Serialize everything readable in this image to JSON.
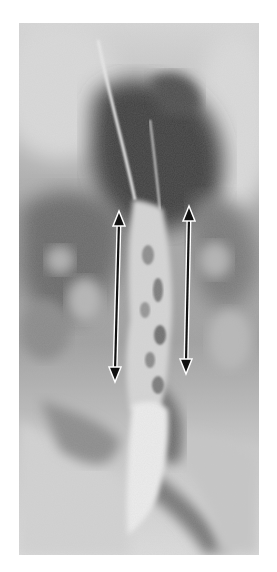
{
  "figure": {
    "type": "barium esophagram radiograph",
    "background": "#ffffff",
    "frame": {
      "x": 19,
      "y": 23,
      "width": 240,
      "height": 532
    },
    "colors": {
      "film_light": "#d4d4d4",
      "film_mid": "#9a9a9a",
      "film_dark": "#4a4a4a",
      "barium": "#e6e6e6",
      "arrow_fill": "#111111",
      "arrow_outline": "#ffffff"
    }
  },
  "annotations": {
    "arrows": [
      {
        "name": "left-double-arrow",
        "x1": 119,
        "y1": 213,
        "x2": 115,
        "y2": 380,
        "style": "double-headed"
      },
      {
        "name": "right-double-arrow",
        "x1": 189,
        "y1": 208,
        "x2": 186,
        "y2": 372,
        "style": "double-headed"
      }
    ]
  }
}
